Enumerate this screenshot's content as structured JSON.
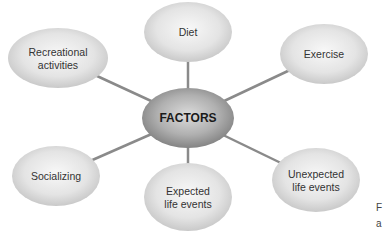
{
  "diagram": {
    "type": "mind-map",
    "center": {
      "label": "FACTORS",
      "cx": 188,
      "cy": 118,
      "rx": 46,
      "ry": 30
    },
    "nodes": [
      {
        "id": "diet",
        "lines": [
          "Diet"
        ],
        "cx": 188,
        "cy": 32,
        "rx": 44,
        "ry": 30
      },
      {
        "id": "exercise",
        "lines": [
          "Exercise"
        ],
        "cx": 324,
        "cy": 54,
        "rx": 44,
        "ry": 30
      },
      {
        "id": "recreational-activities",
        "lines": [
          "Recreational",
          "activities"
        ],
        "cx": 58,
        "cy": 58,
        "rx": 50,
        "ry": 30
      },
      {
        "id": "socializing",
        "lines": [
          "Socializing"
        ],
        "cx": 56,
        "cy": 176,
        "rx": 44,
        "ry": 30
      },
      {
        "id": "expected-life-events",
        "lines": [
          "Expected",
          "life events"
        ],
        "cx": 188,
        "cy": 197,
        "rx": 44,
        "ry": 34
      },
      {
        "id": "unexpected-life-events",
        "lines": [
          "Unexpected",
          "life events"
        ],
        "cx": 316,
        "cy": 180,
        "rx": 44,
        "ry": 32
      }
    ],
    "colors": {
      "edge": "#8a8a8a",
      "node_light": "#f7f7f7",
      "node_dark": "#c4c4c4",
      "center_light": "#d9d9d9",
      "center_dark": "#7a7a7a"
    }
  },
  "edge_text": {
    "line1": "F",
    "line2": "a"
  }
}
